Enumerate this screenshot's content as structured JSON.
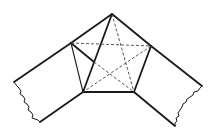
{
  "diagram": {
    "colors": {
      "line": "#1a1a1a",
      "dashed": "#444444",
      "background": "#ffffff"
    },
    "points": {
      "apex": [
        112,
        14
      ],
      "left": [
        71,
        43
      ],
      "right": [
        151,
        46
      ],
      "bottom_left": [
        83,
        92
      ],
      "bottom_right": [
        134,
        92
      ],
      "left_crease": [
        94,
        62
      ],
      "left_strip_outer": [
        14,
        82
      ],
      "left_strip_end": [
        40,
        122
      ],
      "right_strip_outer": [
        202,
        86
      ],
      "right_strip_end": [
        175,
        126
      ]
    },
    "solid_edges": [
      {
        "from": "left_strip_outer",
        "to": "apex",
        "weight": "thick"
      },
      {
        "from": "apex",
        "to": "right_strip_outer",
        "weight": "thick"
      },
      {
        "from": "apex",
        "to": "bottom_left",
        "weight": "thick"
      },
      {
        "from": "left",
        "to": "bottom_left",
        "weight": "thin"
      },
      {
        "from": "left",
        "to": "left_crease",
        "weight": "thick"
      },
      {
        "from": "bottom_left",
        "to": "bottom_right",
        "weight": "thick"
      },
      {
        "from": "right",
        "to": "bottom_right",
        "weight": "thick"
      },
      {
        "from": "bottom_left",
        "to": "left_strip_end",
        "weight": "thick"
      },
      {
        "from": "bottom_right",
        "to": "right_strip_end",
        "weight": "thick"
      }
    ],
    "dashed_edges": [
      {
        "from": "left",
        "to": "right"
      },
      {
        "from": "apex",
        "to": "bottom_right"
      },
      {
        "from": "left",
        "to": "bottom_right"
      },
      {
        "from": "right",
        "to": "bottom_left"
      }
    ],
    "torn_edges": [
      "left strip end",
      "right strip end"
    ]
  }
}
